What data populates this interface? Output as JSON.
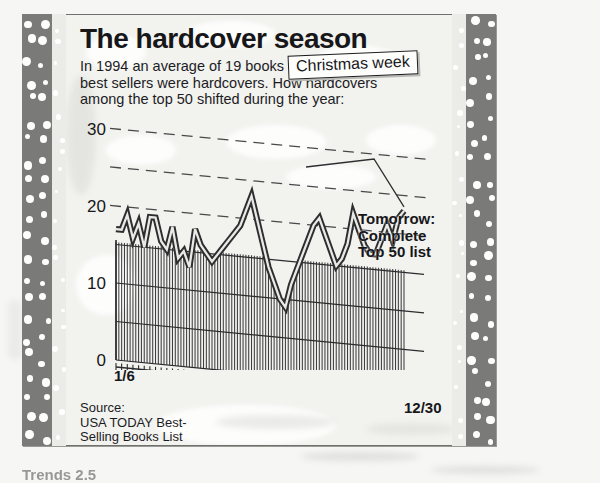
{
  "headline": "The hardcover season",
  "deck": [
    "In 1994 an average of 19 books among the 50",
    "best sellers were hardcovers. How hardcovers",
    "among the top 50 shifted during the year:"
  ],
  "annotations": {
    "christmas_week": "Christmas week",
    "tomorrow": [
      "Tomorrow:",
      "Complete",
      "Top 50 list"
    ]
  },
  "axis": {
    "y_ticks": [
      "30",
      "20",
      "10",
      "0"
    ],
    "x_start": "1/6",
    "x_end": "12/30"
  },
  "source": [
    "Source:",
    "USA TODAY Best-",
    "Selling Books List"
  ],
  "fragment": "Trends 2.5",
  "colors": {
    "ink": "#17171a",
    "line": "#55555a",
    "grid": "#2b2b2e",
    "paper": "#f2f2ef",
    "band": "#7a7a78"
  },
  "chart_data": {
    "type": "line",
    "title": "The hardcover season",
    "subtitle": "In 1994 an average of 19 books among the 50 best sellers were hardcovers. How hardcovers among the top 50 shifted during the year:",
    "xlabel": "",
    "ylabel": "Number of hardcovers in top 50",
    "ylim": [
      0,
      30
    ],
    "yticks": [
      0,
      10,
      20,
      30
    ],
    "gridlines": {
      "solid": [
        0,
        5,
        10,
        15
      ],
      "dashed": [
        20,
        25,
        30
      ]
    },
    "grid": true,
    "legend": "none",
    "area_fill": "vertical-hatch",
    "annotations": [
      {
        "text": "Christmas week",
        "points_to_x": "12/23",
        "points_to_y": 25
      },
      {
        "text": "Tomorrow: Complete Top 50 list",
        "type": "promo"
      }
    ],
    "x_tick_labels": [
      "1/6",
      "12/30"
    ],
    "x": [
      "1/6",
      "1/13",
      "1/20",
      "1/27",
      "2/3",
      "2/10",
      "2/17",
      "2/24",
      "3/3",
      "3/10",
      "3/17",
      "3/24",
      "3/31",
      "4/7",
      "4/14",
      "4/21",
      "4/28",
      "5/5",
      "5/12",
      "5/19",
      "5/26",
      "6/2",
      "6/9",
      "6/16",
      "6/23",
      "6/30",
      "7/7",
      "7/14",
      "7/21",
      "7/28",
      "8/4",
      "8/11",
      "8/18",
      "8/25",
      "9/1",
      "9/8",
      "9/15",
      "9/22",
      "9/29",
      "10/6",
      "10/13",
      "10/20",
      "10/27",
      "11/3",
      "11/10",
      "11/17",
      "11/24",
      "12/2",
      "12/9",
      "12/16",
      "12/23",
      "12/30"
    ],
    "series": [
      {
        "name": "Hardcovers among top 50",
        "values": [
          17,
          17,
          19,
          16,
          18,
          15,
          19,
          19,
          16,
          15,
          18,
          14,
          15,
          13,
          18,
          16,
          15,
          14,
          15,
          16,
          17,
          18,
          19,
          21,
          23,
          20,
          17,
          14,
          12,
          10,
          9,
          12,
          14,
          16,
          18,
          20,
          21,
          19,
          17,
          15,
          16,
          18,
          22,
          20,
          18,
          17,
          17,
          19,
          21,
          19,
          22,
          23
        ]
      }
    ]
  }
}
